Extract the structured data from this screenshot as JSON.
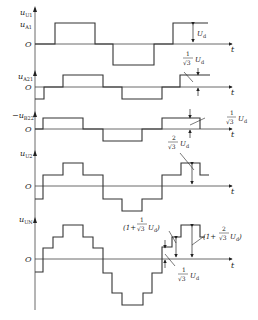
{
  "diagram": {
    "type": "waveform",
    "axis_x": 35,
    "axis_end_x": 232,
    "stroke_color": "#333333",
    "panels": [
      {
        "id": "uU1",
        "ylabel_main": "u",
        "ylabel_sub": "U1",
        "ylabel2_main": "u",
        "ylabel2_sub": "A1",
        "origin_label": "O",
        "t_label": "t",
        "baseline_y": 44,
        "axis_top_y": 8,
        "path": "M35,44 L55,44 L55,23 L95,23 L95,44 L113,44 L113,65 L154,65 L154,44 L173,44 L173,23 L208,23",
        "annotation": {
          "text": "U",
          "sub": "d"
        }
      },
      {
        "id": "uA21",
        "ylabel_main": "u",
        "ylabel_sub": "A21",
        "origin_label": "O",
        "t_label": "t",
        "baseline_y": 87,
        "axis_top_y": 72,
        "path": "M35,99 L44,99 L44,87 L63,87 L63,75 L103,75 L103,87 L122,87 L122,99 L162,99 L162,87 L180,87 L180,75 L210,75",
        "annotation": {
          "num": "1",
          "den": "√3",
          "text": "U",
          "sub": "d"
        }
      },
      {
        "id": "uB22",
        "ylabel_main": "−u",
        "ylabel_sub": "B22",
        "origin_label": "O",
        "t_label": "t",
        "baseline_y": 129,
        "axis_top_y": 112,
        "path": "M35,129 L43,129 L43,118 L83,118 L83,129 L103,129 L103,141 L142,141 L142,129 L162,129 L162,118 L200,118 L200,129",
        "annotation": {
          "num": "1",
          "den": "√3",
          "text": "U",
          "sub": "d"
        }
      },
      {
        "id": "uU2",
        "ylabel_main": "u",
        "ylabel_sub": "U2",
        "origin_label": "O",
        "t_label": "t",
        "baseline_y": 186,
        "axis_top_y": 150,
        "path": "M35,199 L43,199 L43,175 L63,175 L63,163 L83,163 L83,175 L103,175 L103,199 L122,199 L122,211 L142,211 L142,199 L162,199 L162,175 L181,175 L181,163 L200,163 L200,175 L209,175",
        "annotation": {
          "num": "2",
          "den": "√3",
          "text": "U",
          "sub": "d"
        }
      },
      {
        "id": "uUN",
        "ylabel_main": "u",
        "ylabel_sub": "UN",
        "origin_label": "O",
        "t_label": "t",
        "baseline_y": 259,
        "axis_top_y": 215,
        "path": "M35,272 L43,272 L43,248 L53,248 L53,237 L63,237 L63,225 L83,225 L83,237 L93,237 L93,248 L103,248 L103,273 L112,273 L112,293 L122,293 L122,305 L143,305 L143,293 L152,293 L152,273 L162,273 L162,247 L172,247 L172,237 L181,237 L181,225 L200,225 L200,237 L205,237",
        "annotations": [
          {
            "id": "one-plus-inv-sqrt3",
            "prefix": "(1+",
            "num": "1",
            "den": "√3",
            "text": "U",
            "sub": "d",
            "suffix": ")"
          },
          {
            "id": "one-plus-two-inv-sqrt3",
            "prefix": "(1+",
            "num": "2",
            "den": "√3",
            "text": "U",
            "sub": "d",
            "suffix": ")"
          },
          {
            "id": "inv-sqrt3",
            "num": "1",
            "den": "√3",
            "text": "U",
            "sub": "d"
          }
        ]
      }
    ]
  }
}
